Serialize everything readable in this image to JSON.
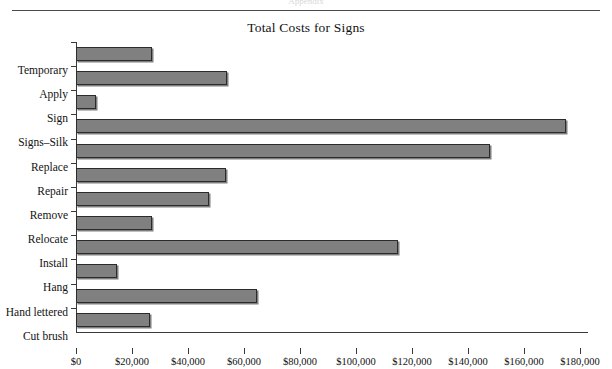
{
  "page": {
    "ghost_header": "Appendix",
    "rule_color": "#4a4a4a"
  },
  "chart_data": {
    "type": "bar",
    "orientation": "horizontal",
    "title": "Total Costs for Signs",
    "xlabel": "",
    "ylabel": "",
    "categories": [
      "Temporary",
      "Apply",
      "Sign",
      "Signs–Silk",
      "Replace",
      "Repair",
      "Remove",
      "Relocate",
      "Install",
      "Hang",
      "Hand lettered",
      "Cut brush"
    ],
    "values": [
      27000,
      54000,
      7000,
      175000,
      148000,
      53500,
      47500,
      27000,
      115000,
      14500,
      64500,
      26500
    ],
    "xlim": [
      0,
      180000
    ],
    "xtick_values": [
      0,
      20000,
      40000,
      60000,
      80000,
      100000,
      120000,
      140000,
      160000,
      180000
    ],
    "xtick_labels": [
      "$0",
      "$20,000",
      "$40,000",
      "$60,000",
      "$80,000",
      "$100,000",
      "$120,000",
      "$140,000",
      "$160,000",
      "$180,000"
    ],
    "grid": false,
    "legend": false,
    "bar_color": "#808080",
    "bar_border_color": "#2b2b2b",
    "axis_color": "#3a3a3a",
    "text_color": "#121212"
  }
}
